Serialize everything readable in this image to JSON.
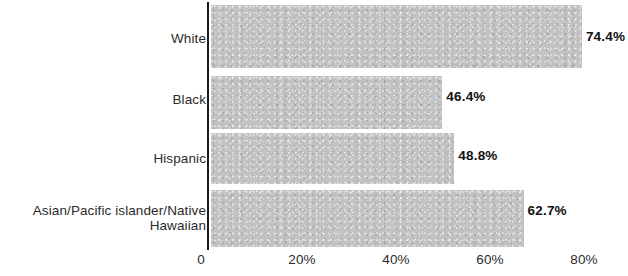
{
  "chart_data": {
    "type": "bar",
    "orientation": "horizontal",
    "title": "",
    "subtitle": "",
    "xlabel": "",
    "ylabel": "",
    "categories": [
      "White",
      "Black",
      "Hispanic",
      "Asian/Pacific islander/Native Hawaiian"
    ],
    "values": [
      74.4,
      46.4,
      48.8,
      62.7
    ],
    "value_labels": [
      "74.4%",
      "46.4%",
      "48.8%",
      "62.7%"
    ],
    "xlim": [
      0,
      80
    ],
    "xticks": [
      0,
      20,
      40,
      60,
      80
    ],
    "xtick_labels": [
      "0",
      "20%",
      "40%",
      "60%",
      "80%"
    ],
    "grid": false,
    "legend": null,
    "bar_color": "#c2c2c2",
    "axis_color": "#1c1c1c",
    "label_color": "#2b2b2b",
    "value_label_color": "#111111",
    "background_color": "#ffffff"
  },
  "category_label_lines": {
    "0": "White",
    "1": "Black",
    "2": "Hispanic",
    "3": "Asian/Pacific islander/Native\nHawaiian"
  }
}
